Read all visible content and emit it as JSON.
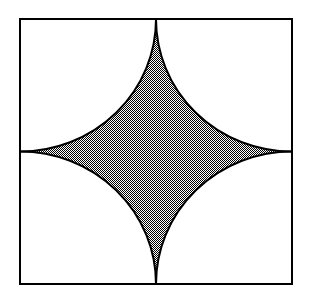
{
  "figure": {
    "title": "Square with four inscribed quarter-circle arcs forming a concave four-pointed star",
    "canvas": {
      "width": 310,
      "height": 302,
      "background": "#ffffff"
    },
    "square": {
      "name": "bounding-square",
      "x": 20,
      "y": 19,
      "width": 272,
      "height": 265,
      "stroke": "#000000",
      "stroke_width": 2,
      "fill": "none",
      "corners": [
        {
          "label": "top-left",
          "x": 20,
          "y": 19
        },
        {
          "label": "top-right",
          "x": 292,
          "y": 19
        },
        {
          "label": "bottom-right",
          "x": 292,
          "y": 284
        },
        {
          "label": "bottom-left",
          "x": 20,
          "y": 284
        }
      ]
    },
    "arcs": [
      {
        "label": "arc-top-left",
        "center_x": 20,
        "center_y": 19,
        "radius_x": 136,
        "radius_y": 132.5
      },
      {
        "label": "arc-top-right",
        "center_x": 292,
        "center_y": 19,
        "radius_x": 136,
        "radius_y": 132.5
      },
      {
        "label": "arc-bottom-right",
        "center_x": 292,
        "center_y": 284,
        "radius_x": 136,
        "radius_y": 132.5
      },
      {
        "label": "arc-bottom-left",
        "center_x": 20,
        "center_y": 284,
        "radius_x": 136,
        "radius_y": 132.5
      }
    ],
    "star": {
      "name": "shaded-star-region",
      "cusps": [
        {
          "label": "top-cusp",
          "x": 156,
          "y": 19
        },
        {
          "label": "right-cusp",
          "x": 292,
          "y": 151.5
        },
        {
          "label": "bottom-cusp",
          "x": 156,
          "y": 284
        },
        {
          "label": "left-cusp",
          "x": 20,
          "y": 151.5
        }
      ],
      "fill_pattern": "checkerboard-dither-50-percent",
      "fill_appearance": "#b9b9b9",
      "stroke": "#000000",
      "stroke_width": 2,
      "path": "M 156 19 A 136 132.5 0 0 0 292 151.5 A 136 132.5 0 0 0 156 284 A 136 132.5 0 0 0 20 151.5 A 136 132.5 0 0 0 156 19 Z"
    },
    "colors": {
      "stroke": "#000000",
      "dither_dark": "#000000",
      "dither_light": "#ffffff",
      "background": "#ffffff"
    }
  }
}
